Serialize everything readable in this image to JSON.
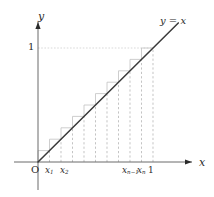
{
  "figure": {
    "axes": {
      "x_axis_label": "x",
      "y_axis_label": "y",
      "origin_label": "O"
    },
    "line": {
      "label_y": "y",
      "label_eq": " = ",
      "label_x": "x",
      "equation": "y = x",
      "color": "#3a3a3a"
    },
    "y_ticks": [
      {
        "value": 1,
        "label": "1",
        "py": 48
      }
    ],
    "x_ticks": [
      {
        "label_base": "x",
        "label_sub": "1",
        "px": 50
      },
      {
        "label_base": "x",
        "label_sub": "2",
        "px": 65
      },
      {
        "label_base": "x",
        "label_sub": "n−1",
        "px": 127
      },
      {
        "label_base": "x",
        "label_sub": "n",
        "px": 142
      },
      {
        "label_base": "1",
        "label_sub": "",
        "px": 153
      }
    ],
    "colors": {
      "axis": "#6b6b6b",
      "curve": "#3a3a3a",
      "dashed": "#b9b9b9",
      "step": "#c2c2c2",
      "guide": "#cfcfcf",
      "text": "#2b2b2b"
    }
  },
  "chart_data": {
    "type": "line",
    "title": "",
    "xlabel": "x",
    "ylabel": "y",
    "xlim": [
      0,
      1.25
    ],
    "ylim": [
      0,
      1.25
    ],
    "grid": false,
    "legend": "none",
    "annotations": [
      "y = x",
      "O",
      "1"
    ],
    "series": [
      {
        "name": "y = x",
        "x": [
          0,
          1.22
        ],
        "values": [
          0,
          1.22
        ]
      }
    ],
    "partition_points": [
      {
        "name": "0",
        "x": 0.0
      },
      {
        "name": "x_1",
        "x": 0.1
      },
      {
        "name": "x_2",
        "x": 0.2
      },
      {
        "name": "x_3",
        "x": 0.3
      },
      {
        "name": "x_4",
        "x": 0.4
      },
      {
        "name": "x_5",
        "x": 0.5
      },
      {
        "name": "x_6",
        "x": 0.6
      },
      {
        "name": "x_7",
        "x": 0.7
      },
      {
        "name": "x_n-1",
        "x": 0.8
      },
      {
        "name": "x_n",
        "x": 0.9
      },
      {
        "name": "1",
        "x": 1.0
      }
    ],
    "rectangles": {
      "kind": "upper-riemann-sum",
      "count": 10,
      "heights": [
        0.1,
        0.2,
        0.3,
        0.4,
        0.5,
        0.6,
        0.7,
        0.8,
        0.9,
        1.0
      ]
    },
    "reference_lines": [
      {
        "orientation": "horizontal",
        "y": 1,
        "from_x": 0,
        "to_x": 1,
        "style": "dotted"
      }
    ]
  }
}
